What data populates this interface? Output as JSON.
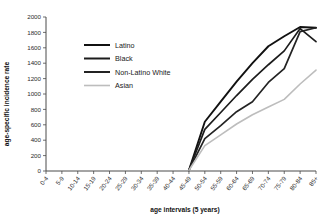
{
  "chart_data": {
    "type": "line",
    "title": "",
    "xlabel": "age intervals (5 years)",
    "ylabel": "age-specific incidence rate",
    "ylim": [
      0,
      2000
    ],
    "ytick_step": 200,
    "yticks": [
      "0",
      "200",
      "400",
      "600",
      "800",
      "1000",
      "1200",
      "1400",
      "1600",
      "1800",
      "2000"
    ],
    "grid": false,
    "legend_position": "upper-left",
    "categories": [
      "0-4",
      "5-9",
      "10-14",
      "15-19",
      "20-24",
      "25-29",
      "30-34",
      "35-39",
      "40-44",
      "45-49",
      "50-54",
      "55-59",
      "60-64",
      "65-69",
      "70-74",
      "75-79",
      "80-84",
      "85+"
    ],
    "series": [
      {
        "name": "Latino",
        "color": "#111111",
        "width": 1.9,
        "values": [
          0,
          0,
          0,
          0,
          0,
          0,
          0,
          0,
          0,
          10,
          640,
          900,
          1160,
          1400,
          1620,
          1750,
          1870,
          1860
        ]
      },
      {
        "name": "Black",
        "color": "#1c1c1c",
        "width": 1.7,
        "values": [
          0,
          0,
          0,
          0,
          0,
          0,
          0,
          0,
          0,
          10,
          540,
          760,
          980,
          1190,
          1380,
          1560,
          1850,
          1680
        ]
      },
      {
        "name": "Non-Latino White",
        "color": "#232323",
        "width": 1.7,
        "values": [
          0,
          0,
          0,
          0,
          0,
          0,
          0,
          0,
          0,
          10,
          420,
          590,
          770,
          900,
          1150,
          1330,
          1810,
          1860
        ]
      },
      {
        "name": "Asian",
        "color": "#bdbdbd",
        "width": 1.6,
        "values": [
          0,
          0,
          0,
          0,
          0,
          0,
          0,
          0,
          0,
          10,
          330,
          470,
          610,
          730,
          830,
          930,
          1130,
          1310
        ]
      }
    ]
  },
  "legend": {
    "items": [
      {
        "label": "Latino",
        "color": "#111111"
      },
      {
        "label": "Black",
        "color": "#1c1c1c"
      },
      {
        "label": "Non-Latino White",
        "color": "#232323"
      },
      {
        "label": "Asian",
        "color": "#bdbdbd"
      }
    ]
  }
}
